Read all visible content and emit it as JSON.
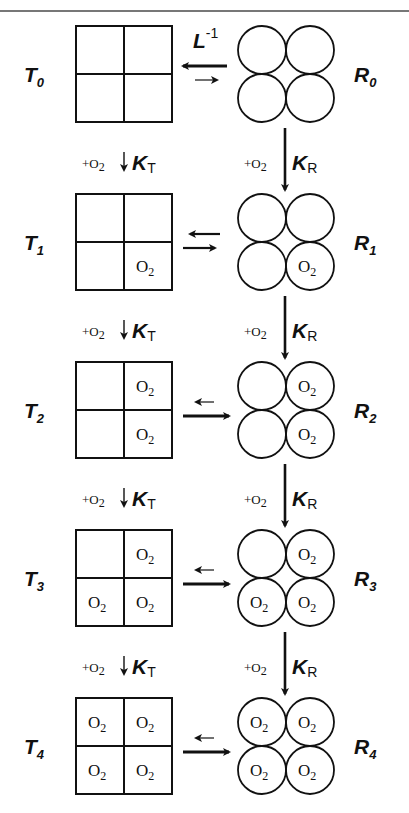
{
  "diagram": {
    "equilibrium_label": "L",
    "equilibrium_label_exponent": "-1",
    "ligand": "O",
    "ligand_subscript": "2",
    "binding_step_prefix": "+",
    "tense_constant": "K",
    "tense_constant_subscript": "T",
    "relaxed_constant": "K",
    "relaxed_constant_subscript": "R",
    "states": [
      {
        "t_label": "T",
        "t_sub": "0",
        "r_label": "R",
        "r_sub": "0",
        "occupied": [
          false,
          false,
          false,
          false
        ],
        "arrow_left": "large",
        "arrow_right": "small"
      },
      {
        "t_label": "T",
        "t_sub": "1",
        "r_label": "R",
        "r_sub": "1",
        "occupied": [
          false,
          false,
          false,
          true
        ],
        "arrow_left": "medium",
        "arrow_right": "medium"
      },
      {
        "t_label": "T",
        "t_sub": "2",
        "r_label": "R",
        "r_sub": "2",
        "occupied": [
          false,
          true,
          false,
          true
        ],
        "arrow_left": "small",
        "arrow_right": "large"
      },
      {
        "t_label": "T",
        "t_sub": "3",
        "r_label": "R",
        "r_sub": "3",
        "occupied": [
          false,
          true,
          true,
          true
        ],
        "arrow_left": "small",
        "arrow_right": "large"
      },
      {
        "t_label": "T",
        "t_sub": "4",
        "r_label": "R",
        "r_sub": "4",
        "occupied": [
          true,
          true,
          true,
          true
        ],
        "arrow_left": "small",
        "arrow_right": "large"
      }
    ],
    "colors": {
      "line": "#111111",
      "rule": "#777777",
      "background": "#ffffff"
    }
  }
}
